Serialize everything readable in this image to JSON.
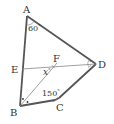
{
  "diagram": {
    "type": "geometry",
    "points": {
      "A": {
        "label": "A",
        "x": 27,
        "y": 16
      },
      "B": {
        "label": "B",
        "x": 20,
        "y": 106
      },
      "C": {
        "label": "C",
        "x": 55,
        "y": 100
      },
      "D": {
        "label": "D",
        "x": 96,
        "y": 64
      },
      "E": {
        "label": "E",
        "x": 22,
        "y": 69
      },
      "F": {
        "label": "F",
        "x": 56,
        "y": 65
      }
    },
    "segments": [
      "AB",
      "AD",
      "BC",
      "CD",
      "ED",
      "BF"
    ],
    "angles": {
      "A": "60°",
      "C": "150°",
      "F": "x°"
    },
    "angle_labels": {
      "a_text": "60",
      "c_text": "150",
      "f_text": "x"
    },
    "marks": {
      "D": "bisector ticks",
      "B": "bisector dots"
    },
    "colors": {
      "stroke": "#555555",
      "thin_stroke": "#777777",
      "text": "#333333"
    }
  }
}
